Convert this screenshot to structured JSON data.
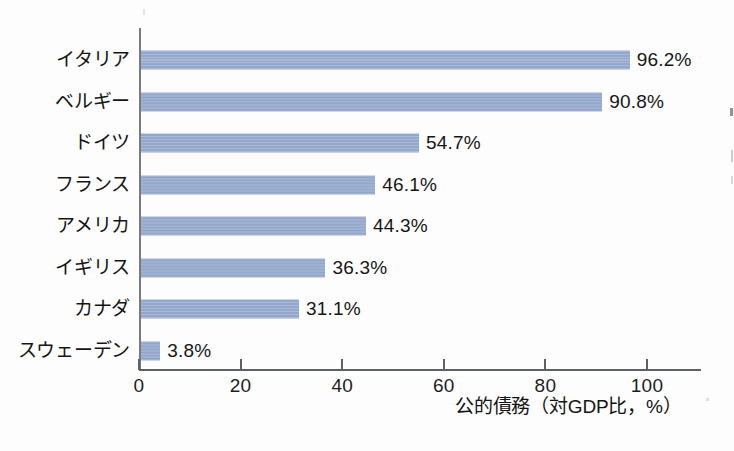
{
  "chart_data": {
    "type": "bar",
    "orientation": "horizontal",
    "title": "",
    "xlabel": "公的債務（対GDP比，%）",
    "ylabel": "",
    "xlim": [
      0,
      110
    ],
    "xticks": [
      "0",
      "20",
      "40",
      "60",
      "80",
      "100"
    ],
    "xtick_values": [
      0,
      20,
      40,
      60,
      80,
      100
    ],
    "grid": false,
    "legend": "none",
    "bar_color": "#93a6cb",
    "categories": [
      "イタリア",
      "ベルギー",
      "ドイツ",
      "フランス",
      "アメリカ",
      "イギリス",
      "カナダ",
      "スウェーデン"
    ],
    "values": [
      96.2,
      90.8,
      54.7,
      46.1,
      44.3,
      36.3,
      31.1,
      3.8
    ],
    "data_labels": [
      "96.2%",
      "90.8%",
      "54.7%",
      "46.1%",
      "44.3%",
      "36.3%",
      "31.1%",
      "3.8%"
    ]
  }
}
